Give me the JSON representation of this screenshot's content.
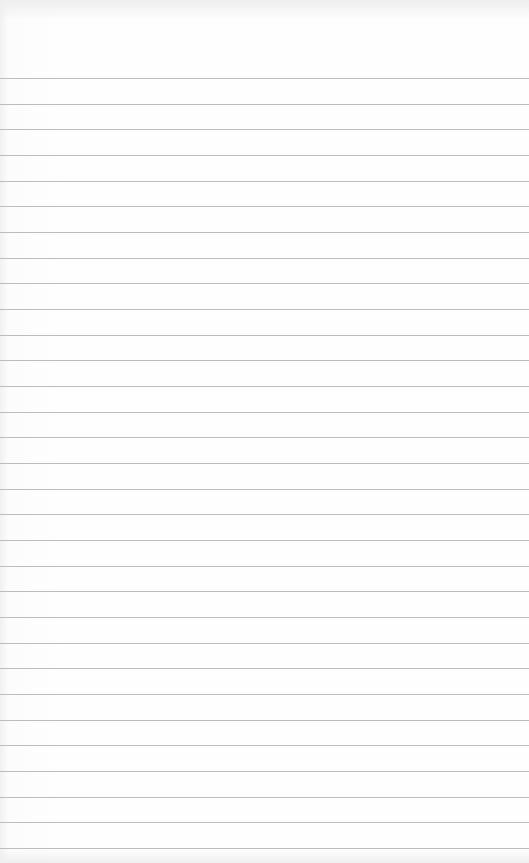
{
  "paper": {
    "type": "lined-paper",
    "background_color": "#fdfdfd",
    "line_color": "#bdbdbd",
    "first_line_y": 78,
    "line_spacing": 25.67,
    "line_count": 31
  }
}
